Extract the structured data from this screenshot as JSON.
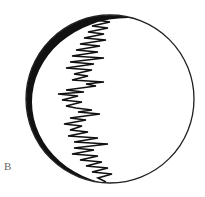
{
  "figure": {
    "panel_label": "B",
    "colors": {
      "background": "#ffffff",
      "outline": "#222222",
      "crescent": "#111111",
      "trace": "#111111",
      "label": "#666666"
    },
    "circle": {
      "cx": 110,
      "cy": 99,
      "r": 84
    },
    "crescent": {
      "inner_cx": 128,
      "inner_cy": 102,
      "inner_rx": 96,
      "inner_ry": 84
    },
    "trace": {
      "description": "zigzag trace running top to bottom inside the circle",
      "points": [
        [
          104,
          16
        ],
        [
          96,
          20
        ],
        [
          110,
          22
        ],
        [
          92,
          26
        ],
        [
          108,
          28
        ],
        [
          88,
          32
        ],
        [
          104,
          34
        ],
        [
          84,
          38
        ],
        [
          106,
          40
        ],
        [
          80,
          44
        ],
        [
          100,
          46
        ],
        [
          76,
          50
        ],
        [
          98,
          52
        ],
        [
          72,
          56
        ],
        [
          104,
          58
        ],
        [
          70,
          62
        ],
        [
          94,
          64
        ],
        [
          66,
          68
        ],
        [
          92,
          70
        ],
        [
          74,
          74
        ],
        [
          88,
          76
        ],
        [
          72,
          80
        ],
        [
          104,
          82
        ],
        [
          86,
          84
        ],
        [
          96,
          86
        ],
        [
          66,
          90
        ],
        [
          84,
          92
        ],
        [
          58,
          94
        ],
        [
          78,
          96
        ],
        [
          62,
          100
        ],
        [
          82,
          102
        ],
        [
          66,
          106
        ],
        [
          76,
          108
        ],
        [
          92,
          110
        ],
        [
          78,
          112
        ],
        [
          100,
          114
        ],
        [
          70,
          118
        ],
        [
          86,
          120
        ],
        [
          64,
          124
        ],
        [
          82,
          126
        ],
        [
          70,
          130
        ],
        [
          88,
          132
        ],
        [
          68,
          136
        ],
        [
          98,
          138
        ],
        [
          74,
          142
        ],
        [
          108,
          144
        ],
        [
          74,
          148
        ],
        [
          94,
          150
        ],
        [
          72,
          154
        ],
        [
          98,
          156
        ],
        [
          80,
          160
        ],
        [
          102,
          162
        ],
        [
          86,
          166
        ],
        [
          108,
          168
        ],
        [
          92,
          172
        ],
        [
          112,
          174
        ],
        [
          98,
          178
        ],
        [
          106,
          182
        ]
      ]
    }
  }
}
